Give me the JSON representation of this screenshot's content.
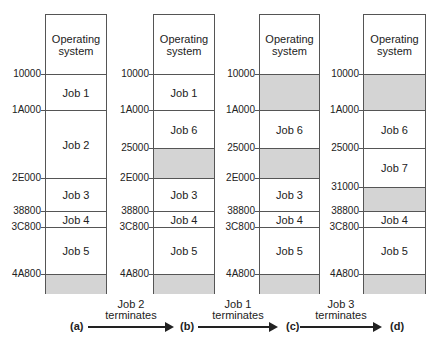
{
  "diagram": {
    "states": [
      {
        "id": "a",
        "label": "(a)",
        "segments": [
          {
            "label": "Operating\nsystem",
            "free": false
          },
          {
            "label": "Job 1",
            "free": false
          },
          {
            "label": "Job 2",
            "free": false
          },
          {
            "label": "Job 3",
            "free": false
          },
          {
            "label": "Job 4",
            "free": false
          },
          {
            "label": "Job 5",
            "free": false
          },
          {
            "label": "",
            "free": true
          }
        ]
      },
      {
        "id": "b",
        "label": "(b)",
        "segments": [
          {
            "label": "Operating\nsystem",
            "free": false
          },
          {
            "label": "Job 1",
            "free": false
          },
          {
            "label": "Job 6",
            "free": false
          },
          {
            "label": "",
            "free": true
          },
          {
            "label": "Job 3",
            "free": false
          },
          {
            "label": "Job 4",
            "free": false
          },
          {
            "label": "Job 5",
            "free": false
          },
          {
            "label": "",
            "free": true
          }
        ]
      },
      {
        "id": "c",
        "label": "(c)",
        "segments": [
          {
            "label": "Operating\nsystem",
            "free": false
          },
          {
            "label": "",
            "free": true
          },
          {
            "label": "Job 6",
            "free": false
          },
          {
            "label": "",
            "free": true
          },
          {
            "label": "Job 3",
            "free": false
          },
          {
            "label": "Job 4",
            "free": false
          },
          {
            "label": "Job 5",
            "free": false
          },
          {
            "label": "",
            "free": true
          }
        ]
      },
      {
        "id": "d",
        "label": "(d)",
        "segments": [
          {
            "label": "Operating\nsystem",
            "free": false
          },
          {
            "label": "",
            "free": true
          },
          {
            "label": "Job 6",
            "free": false
          },
          {
            "label": "Job 7",
            "free": false
          },
          {
            "label": "",
            "free": true
          },
          {
            "label": "Job 4",
            "free": false
          },
          {
            "label": "Job 5",
            "free": false
          },
          {
            "label": "",
            "free": true
          }
        ]
      }
    ],
    "addresses": {
      "a": [
        "10000",
        "1A000",
        "2E000",
        "38800",
        "3C800",
        "4A800"
      ],
      "b": [
        "10000",
        "1A000",
        "25000",
        "2E000",
        "38800",
        "3C800",
        "4A800"
      ],
      "c": [
        "10000",
        "1A000",
        "25000",
        "2E000",
        "38800",
        "3C800",
        "4A800"
      ],
      "d": [
        "10000",
        "1A000",
        "25000",
        "31000",
        "38800",
        "3C800",
        "4A800"
      ]
    },
    "transitions": [
      {
        "line1": "Job 2",
        "line2": "terminates"
      },
      {
        "line1": "Job 1",
        "line2": "terminates"
      },
      {
        "line1": "Job 3",
        "line2": "terminates"
      }
    ],
    "colors": {
      "free": "#d4d4d4",
      "border": "#555555"
    }
  }
}
